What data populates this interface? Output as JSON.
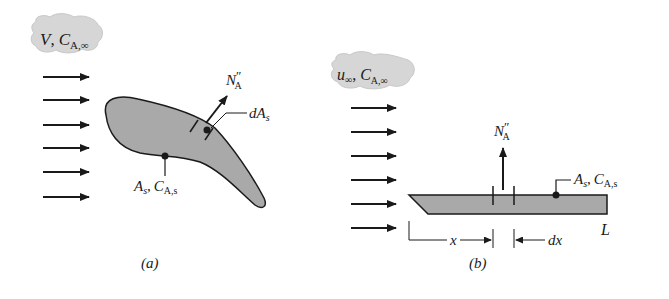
{
  "colors": {
    "body_fill": "#a9a9a9",
    "outline": "#1a1a1a",
    "cloud_fill": "#d6d6d6",
    "background": "#ffffff"
  },
  "panel_a": {
    "cloud_label": {
      "v": "V",
      "sep": ",",
      "c": "C",
      "sub": "A,∞"
    },
    "flux_label": {
      "n": "N",
      "prime": "″",
      "sub": "A"
    },
    "area_element_label": {
      "d": "dA",
      "sub": "s"
    },
    "surface_label": {
      "a": "A",
      "a_sub": "s",
      "sep": ",",
      "c": "C",
      "c_sub": "A,s"
    },
    "caption": "(a)",
    "arrow_count": 6
  },
  "panel_b": {
    "cloud_label": {
      "u": "u",
      "u_sub": "∞",
      "sep": ",",
      "c": "C",
      "c_sub": "A,∞"
    },
    "flux_label": {
      "n": "N",
      "prime": "″",
      "sub": "A"
    },
    "surface_label": {
      "a": "A",
      "a_sub": "s",
      "sep": ",",
      "c": "C",
      "c_sub": "A,s"
    },
    "length_label": "L",
    "x_label": "x",
    "dx_label": "dx",
    "caption": "(b)",
    "arrow_count": 6
  }
}
